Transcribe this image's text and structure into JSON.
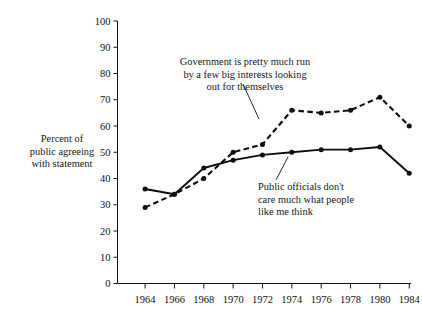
{
  "axis_title": "Percent of\npublic agreeing\nwith statement",
  "annotations": {
    "government": "Government is pretty much run\nby a few big interests looking\nout for themselves",
    "public_officials": "Public officials don't\ncare much what people\nlike me think"
  },
  "chart_data": {
    "type": "line",
    "title": "",
    "xlabel": "",
    "ylabel": "Percent of public agreeing with statement",
    "categories": [
      "1964",
      "1966",
      "1968",
      "1970",
      "1972",
      "1974",
      "1976",
      "1978",
      "1980",
      "1984"
    ],
    "x": [
      1964,
      1966,
      1968,
      1970,
      1972,
      1974,
      1976,
      1978,
      1980,
      1984
    ],
    "xlim": [
      1964,
      1984
    ],
    "ylim": [
      0,
      100
    ],
    "yticks": [
      0,
      10,
      20,
      30,
      40,
      50,
      60,
      70,
      80,
      90,
      100
    ],
    "ytick_labels": [
      "0",
      "10",
      "20",
      "30",
      "40",
      "50",
      "60",
      "70",
      "80",
      "90",
      "100"
    ],
    "grid": false,
    "legend": "annotations-inline",
    "series": [
      {
        "name": "Government is pretty much run by a few big interests looking out for themselves",
        "style": "dashed",
        "values": [
          29,
          34,
          40,
          50,
          53,
          66,
          65,
          66,
          71,
          60
        ]
      },
      {
        "name": "Public officials don't care much what people like me think",
        "style": "solid",
        "values": [
          36,
          34,
          44,
          47,
          49,
          50,
          51,
          51,
          52,
          42
        ]
      }
    ]
  }
}
